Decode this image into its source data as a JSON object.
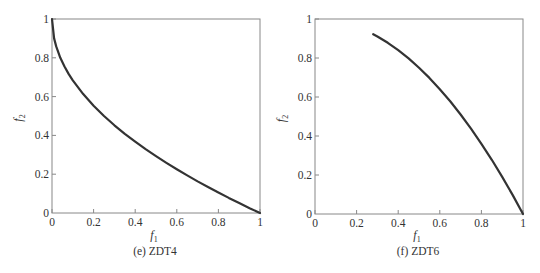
{
  "chart_data": [
    {
      "type": "line",
      "id": "zdt4",
      "caption": "(e)  ZDT4",
      "xlabel": "f1",
      "ylabel": "f2",
      "xlim": [
        0,
        1
      ],
      "ylim": [
        0,
        1
      ],
      "xticks": [
        "0",
        "0.2",
        "0.4",
        "0.6",
        "0.8",
        "1"
      ],
      "yticks": [
        "0",
        "0.2",
        "0.4",
        "0.6",
        "0.8",
        "1"
      ],
      "grid": false,
      "legend": null,
      "series": [
        {
          "name": "Pareto front (f2 = 1 - sqrt(f1))",
          "x": [
            0,
            0.01,
            0.02,
            0.04,
            0.06,
            0.08,
            0.1,
            0.15,
            0.2,
            0.25,
            0.3,
            0.35,
            0.4,
            0.45,
            0.5,
            0.55,
            0.6,
            0.65,
            0.7,
            0.75,
            0.8,
            0.85,
            0.9,
            0.95,
            1
          ],
          "y": [
            1,
            0.9,
            0.859,
            0.8,
            0.755,
            0.717,
            0.684,
            0.613,
            0.553,
            0.5,
            0.452,
            0.408,
            0.368,
            0.329,
            0.293,
            0.258,
            0.225,
            0.194,
            0.163,
            0.134,
            0.106,
            0.078,
            0.051,
            0.025,
            0
          ]
        }
      ]
    },
    {
      "type": "line",
      "id": "zdt6",
      "caption": "(f)  ZDT6",
      "xlabel": "f1",
      "ylabel": "f2",
      "xlim": [
        0,
        1
      ],
      "ylim": [
        0,
        1
      ],
      "xticks": [
        "0",
        "0.2",
        "0.4",
        "0.6",
        "0.8",
        "1"
      ],
      "yticks": [
        "0",
        "0.2",
        "0.4",
        "0.6",
        "0.8",
        "1"
      ],
      "grid": false,
      "legend": null,
      "series": [
        {
          "name": "Pareto front (f2 = 1 - f1^2)",
          "x": [
            0.28,
            0.3,
            0.35,
            0.4,
            0.45,
            0.5,
            0.55,
            0.6,
            0.65,
            0.7,
            0.75,
            0.8,
            0.85,
            0.9,
            0.95,
            1
          ],
          "y": [
            0.922,
            0.91,
            0.878,
            0.84,
            0.798,
            0.75,
            0.698,
            0.64,
            0.578,
            0.51,
            0.438,
            0.36,
            0.278,
            0.19,
            0.098,
            0
          ]
        }
      ]
    }
  ],
  "style": {
    "axis_color": "#888888",
    "line_color": "#333333",
    "text_color": "#333333"
  }
}
